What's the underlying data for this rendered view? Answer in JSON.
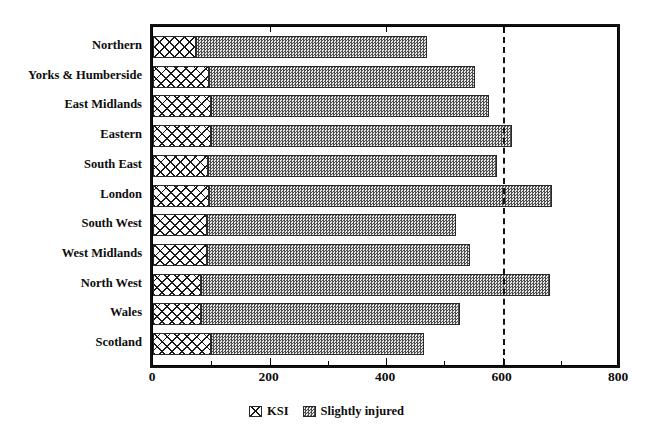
{
  "chart_data": {
    "type": "bar",
    "orientation": "horizontal",
    "stacked": true,
    "title": "",
    "subtitle": "",
    "xlabel": "",
    "ylabel": "",
    "xlim": [
      0,
      800
    ],
    "ylim": null,
    "grid": false,
    "legend_position": "bottom-center",
    "xticks": [
      0,
      200,
      400,
      600,
      800
    ],
    "xtick_labels": [
      "0",
      "200",
      "400",
      "600",
      "800"
    ],
    "xminor_ticks": [
      100,
      300,
      500,
      700
    ],
    "annotations": [
      {
        "type": "vertical-dashed-line",
        "value": 600,
        "label": ""
      }
    ],
    "categories": [
      "Northern",
      "Yorks & Humberside",
      "East Midlands",
      "Eastern",
      "South East",
      "London",
      "South West",
      "West Midlands",
      "North West",
      "Wales",
      "Scotland"
    ],
    "series": [
      {
        "name": "KSI",
        "pattern": "cross-hatch",
        "color": "#ffffff",
        "values": [
          74,
          96,
          100,
          100,
          95,
          96,
          93,
          93,
          83,
          83,
          100
        ]
      },
      {
        "name": "Slightly injured",
        "pattern": "checkerboard-dither",
        "color": "#808080",
        "values": [
          396,
          456,
          477,
          516,
          495,
          589,
          428,
          451,
          599,
          444,
          366
        ]
      }
    ],
    "totals": [
      470,
      552,
      577,
      616,
      590,
      685,
      521,
      544,
      682,
      527,
      466
    ]
  },
  "legend": {
    "items": [
      {
        "label": "KSI",
        "swatch": "cross-hatch-swatch"
      },
      {
        "label": "Slightly injured",
        "swatch": "dither-swatch"
      }
    ]
  }
}
